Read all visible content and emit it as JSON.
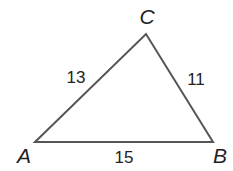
{
  "diagram": {
    "type": "triangle",
    "stroke_color": "#555555",
    "vertices": [
      {
        "name": "A",
        "x": 35,
        "y": 142,
        "label_x": 24,
        "label_y": 163
      },
      {
        "name": "B",
        "x": 213,
        "y": 142,
        "label_x": 220,
        "label_y": 163
      },
      {
        "name": "C",
        "x": 146,
        "y": 34,
        "label_x": 147,
        "label_y": 24
      }
    ],
    "sides": [
      {
        "name": "AC",
        "length": "13",
        "label_x": 76,
        "label_y": 83
      },
      {
        "name": "CB",
        "length": "11",
        "label_x": 196,
        "label_y": 85
      },
      {
        "name": "AB",
        "length": "15",
        "label_x": 124,
        "label_y": 163
      }
    ]
  }
}
